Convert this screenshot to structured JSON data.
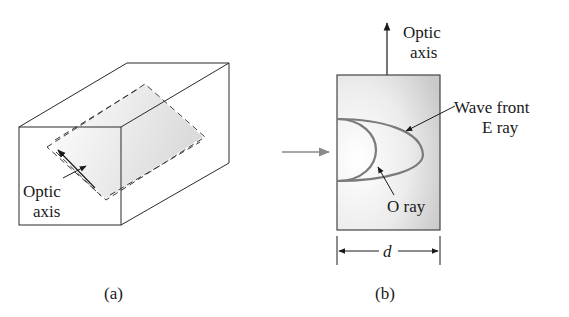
{
  "figure": {
    "panel_a": {
      "caption": "(a)",
      "labels": {
        "optic_axis_line1": "Optic",
        "optic_axis_line2": "axis"
      }
    },
    "panel_b": {
      "caption": "(b)",
      "labels": {
        "optic_axis_line1": "Optic",
        "optic_axis_line2": "axis",
        "wave_front_line1": "Wave front",
        "wave_front_line2": "E ray",
        "o_ray": "O ray",
        "thickness": "d"
      }
    },
    "colors": {
      "line": "#2a2a2a",
      "curve": "#7a7a7a",
      "incident_arrow": "#8a8a8a",
      "shade": "#d9d9d9"
    }
  }
}
